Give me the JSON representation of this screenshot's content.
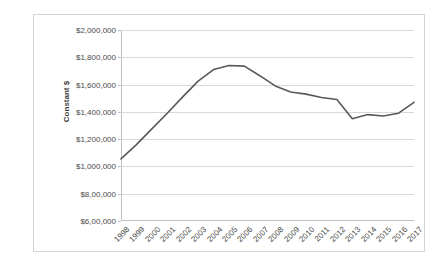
{
  "chart_data": {
    "type": "line",
    "title": "",
    "subtitle": "",
    "xlabel": "",
    "ylabel": "Constant $",
    "categories": [
      "1998",
      "1999",
      "2000",
      "2001",
      "2002",
      "2003",
      "2004",
      "2005",
      "2006",
      "2007",
      "2008",
      "2009",
      "2010",
      "2011",
      "2012",
      "2013",
      "2014",
      "2015",
      "2016",
      "2017"
    ],
    "series": [
      {
        "name": "Constant $",
        "color": "#595959",
        "values": [
          1055000,
          1160000,
          1275000,
          1390000,
          1510000,
          1625000,
          1710000,
          1740000,
          1735000,
          1665000,
          1590000,
          1545000,
          1530000,
          1505000,
          1490000,
          1350000,
          1380000,
          1370000,
          1390000,
          1470000
        ]
      }
    ],
    "ylim": [
      600000,
      2000000
    ],
    "y_ticks": [
      600000,
      800000,
      1000000,
      1200000,
      1400000,
      1600000,
      1800000,
      2000000
    ],
    "y_tick_labels": [
      "$6,00,000",
      "$8,00,000",
      "$1,000,000",
      "$1,200,000",
      "$1,400,000",
      "$1,600,000",
      "$1,800,000",
      "$2,000,000"
    ],
    "grid": "horizontal",
    "legend": "none",
    "markers": false,
    "x_label_rotation": -45
  },
  "style": {
    "line_color": "#595959",
    "gridline_color": "#d9d9d9",
    "axis_color": "#bfbfbf",
    "border_color": "#d4d4d4",
    "text_color": "#4a4a4a",
    "background": "#ffffff"
  }
}
